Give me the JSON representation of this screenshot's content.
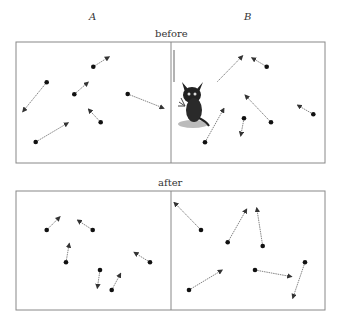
{
  "labels": {
    "col_a": "A",
    "col_b": "B",
    "before": "before",
    "after": "after"
  },
  "colors": {
    "frame": "#888888",
    "dot": "#111111",
    "arrow": "#777777"
  },
  "panels": {
    "before": {
      "box": {
        "x": 16,
        "y": 42,
        "w": 309,
        "h": 121,
        "divider_x": 171
      },
      "A": [
        {
          "dot": [
            46.7,
            82.3
          ],
          "head": [
            22.7,
            111.7
          ]
        },
        {
          "dot": [
            93.3,
            66.7
          ],
          "head": [
            109.3,
            56.7
          ]
        },
        {
          "dot": [
            74.3,
            94.3
          ],
          "head": [
            88.3,
            82
          ]
        },
        {
          "dot": [
            127.7,
            94
          ],
          "head": [
            164,
            108.3
          ]
        },
        {
          "dot": [
            100.7,
            122.3
          ],
          "head": [
            88.3,
            109
          ]
        },
        {
          "dot": [
            35.7,
            142
          ],
          "head": [
            68.3,
            122.7
          ]
        }
      ],
      "B": [
        {
          "dot": [
            217.3,
            81.7
          ],
          "head": [
            242.7,
            55.7
          ],
          "dot_hidden": true
        },
        {
          "dot": [
            266.7,
            66.7
          ],
          "head": [
            251.7,
            57.7
          ]
        },
        {
          "dot": [
            205,
            142.3
          ],
          "head": [
            224,
            108.3
          ]
        },
        {
          "dot": [
            244,
            118.3
          ],
          "head": [
            240.7,
            136
          ]
        },
        {
          "dot": [
            271,
            122.3
          ],
          "head": [
            245,
            95
          ]
        },
        {
          "dot": [
            313.3,
            114.3
          ],
          "head": [
            297.3,
            105
          ]
        }
      ],
      "extra_line": {
        "x": 174,
        "y1": 50,
        "y2": 82
      },
      "mascot": {
        "name": "bsd-daemon",
        "x": 177,
        "y": 80,
        "w": 32,
        "h": 48
      }
    },
    "after": {
      "box": {
        "x": 16,
        "y": 191,
        "w": 309,
        "h": 119,
        "divider_x": 171
      },
      "A": [
        {
          "dot": [
            46.7,
            230
          ],
          "head": [
            60,
            216.7
          ]
        },
        {
          "dot": [
            92.7,
            230
          ],
          "head": [
            77.3,
            220
          ]
        },
        {
          "dot": [
            66,
            262.3
          ],
          "head": [
            69.3,
            243.3
          ]
        },
        {
          "dot": [
            150,
            262.3
          ],
          "head": [
            134,
            252.3
          ]
        },
        {
          "dot": [
            100,
            270
          ],
          "head": [
            97.3,
            288.3
          ]
        },
        {
          "dot": [
            111.7,
            290
          ],
          "head": [
            120.7,
            273.3
          ]
        }
      ],
      "B": [
        {
          "dot": [
            201,
            230
          ],
          "head": [
            174,
            202.3
          ]
        },
        {
          "dot": [
            227.7,
            242.3
          ],
          "head": [
            246.7,
            209
          ]
        },
        {
          "dot": [
            262.7,
            246
          ],
          "head": [
            256.7,
            207.7
          ]
        },
        {
          "dot": [
            189,
            290
          ],
          "head": [
            222.3,
            270
          ]
        },
        {
          "dot": [
            255,
            270
          ],
          "head": [
            291.7,
            276.7
          ]
        },
        {
          "dot": [
            305,
            262.3
          ],
          "head": [
            292.7,
            298.3
          ]
        }
      ]
    }
  }
}
